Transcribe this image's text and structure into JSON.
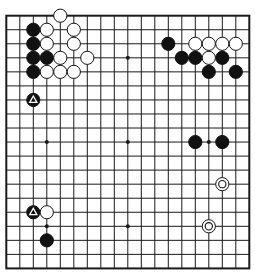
{
  "board": {
    "size": 19,
    "origin_x": 6.3,
    "origin_y": 15.7,
    "spacing_x": 13.5,
    "spacing_y": 14.04,
    "stone_radius": 6.6,
    "line_color": "#1a1a1a",
    "border_width": 2,
    "line_width": 1,
    "background": "#ffffff",
    "hoshi": [
      [
        3,
        3
      ],
      [
        9,
        3
      ],
      [
        15,
        3
      ],
      [
        3,
        9
      ],
      [
        9,
        9
      ],
      [
        15,
        9
      ],
      [
        3,
        15
      ],
      [
        9,
        15
      ],
      [
        15,
        15
      ]
    ]
  },
  "stones": [
    {
      "color": "black",
      "col": 2,
      "row": 1
    },
    {
      "color": "black",
      "col": 2,
      "row": 2
    },
    {
      "color": "black",
      "col": 2,
      "row": 3
    },
    {
      "color": "black",
      "col": 3,
      "row": 3
    },
    {
      "color": "black",
      "col": 2,
      "row": 4
    },
    {
      "color": "black",
      "col": 2,
      "row": 6,
      "marker": "triangle"
    },
    {
      "color": "black",
      "col": 12,
      "row": 2
    },
    {
      "color": "black",
      "col": 13,
      "row": 3
    },
    {
      "color": "black",
      "col": 14,
      "row": 3
    },
    {
      "color": "black",
      "col": 16,
      "row": 3
    },
    {
      "color": "black",
      "col": 15,
      "row": 4
    },
    {
      "color": "black",
      "col": 17,
      "row": 4
    },
    {
      "color": "black",
      "col": 14,
      "row": 9
    },
    {
      "color": "black",
      "col": 16,
      "row": 9
    },
    {
      "color": "black",
      "col": 2,
      "row": 14,
      "marker": "triangle"
    },
    {
      "color": "black",
      "col": 3,
      "row": 16
    },
    {
      "color": "white",
      "col": 4,
      "row": 0
    },
    {
      "color": "white",
      "col": 3,
      "row": 1
    },
    {
      "color": "white",
      "col": 5,
      "row": 1
    },
    {
      "color": "white",
      "col": 3,
      "row": 2
    },
    {
      "color": "white",
      "col": 5,
      "row": 2
    },
    {
      "color": "white",
      "col": 4,
      "row": 3
    },
    {
      "color": "white",
      "col": 6,
      "row": 3
    },
    {
      "color": "white",
      "col": 3,
      "row": 4
    },
    {
      "color": "white",
      "col": 4,
      "row": 4
    },
    {
      "color": "white",
      "col": 5,
      "row": 4
    },
    {
      "color": "white",
      "col": 14,
      "row": 2
    },
    {
      "color": "white",
      "col": 15,
      "row": 2
    },
    {
      "color": "white",
      "col": 16,
      "row": 2
    },
    {
      "color": "white",
      "col": 17,
      "row": 2
    },
    {
      "color": "white",
      "col": 15,
      "row": 3
    },
    {
      "color": "white",
      "col": 3,
      "row": 14
    },
    {
      "color": "white",
      "col": 16,
      "row": 12,
      "marker": "circle"
    },
    {
      "color": "white",
      "col": 15,
      "row": 15,
      "marker": "circle"
    }
  ],
  "colors": {
    "black_stone": "#111111",
    "white_stone": "#ffffff",
    "stone_outline": "#111111",
    "marker_on_black": "#ffffff",
    "marker_on_white": "#111111"
  }
}
